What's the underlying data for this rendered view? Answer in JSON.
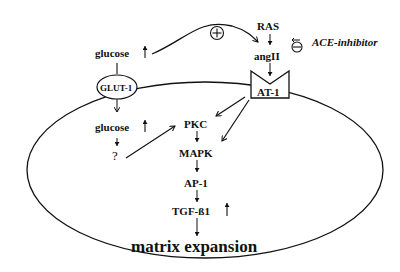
{
  "diagram": {
    "nodes": {
      "glucose_outside": "glucose",
      "glucose_outside_arrow": "↑",
      "glut1": "GLUT-1",
      "glucose_inside": "glucose",
      "glucose_inside_arrow": "↑",
      "unknown": "?",
      "ras": "RAS",
      "angII": "angII",
      "at1": "AT-1",
      "ace_inhibitor": "ACE-inhibitor",
      "pkc": "PKC",
      "mapk": "MAPK",
      "ap1": "AP-1",
      "tgfb1": "TGF-ß1",
      "tgfb1_arrow": "↑",
      "matrix_expansion": "matrix expansion"
    },
    "symbols": {
      "plus": "+",
      "minus": "−"
    },
    "edges": [
      {
        "from": "glucose_outside",
        "to": "angII",
        "type": "stimulates",
        "label": "+"
      },
      {
        "from": "ACE-inhibitor",
        "to": "RAS→angII",
        "type": "inhibits",
        "label": "−"
      },
      {
        "from": "RAS",
        "to": "angII"
      },
      {
        "from": "angII",
        "to": "AT-1"
      },
      {
        "from": "glucose_outside",
        "to": "GLUT-1"
      },
      {
        "from": "GLUT-1",
        "to": "glucose_inside"
      },
      {
        "from": "glucose_inside",
        "to": "?"
      },
      {
        "from": "?",
        "to": "PKC"
      },
      {
        "from": "AT-1",
        "to": "PKC"
      },
      {
        "from": "AT-1",
        "to": "MAPK"
      },
      {
        "from": "PKC",
        "to": "MAPK"
      },
      {
        "from": "MAPK",
        "to": "AP-1"
      },
      {
        "from": "AP-1",
        "to": "TGF-ß1"
      },
      {
        "from": "TGF-ß1",
        "to": "matrix expansion"
      }
    ]
  }
}
